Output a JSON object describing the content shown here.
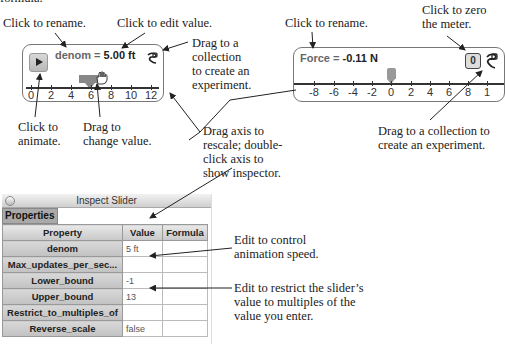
{
  "annotations": {
    "top_cut": "formula.",
    "left_rename": "Click to rename.",
    "left_edit_value": "Click to edit value.",
    "left_drag_collection": [
      "Drag to a",
      "collection",
      "to create an",
      "experiment."
    ],
    "click_animate": [
      "Click to",
      "animate."
    ],
    "drag_change": [
      "Drag to",
      "change value."
    ],
    "drag_axis": [
      "Drag axis to",
      "rescale; double-",
      "click axis to",
      "show inspector."
    ],
    "right_rename": "Click to rename.",
    "zero_meter": [
      "Click to zero",
      "the meter."
    ],
    "right_drag_collection": [
      "Drag to a collection to",
      "create an experiment."
    ],
    "edit_speed": [
      "Edit to control",
      "animation speed."
    ],
    "edit_restrict": [
      "Edit to restrict the slider’s",
      "value to multiples of the",
      "value you enter."
    ]
  },
  "slider": {
    "name": "denom",
    "equals": " = ",
    "value": "5.00 ft",
    "play_icon": "play-icon",
    "tick_labels": [
      "0",
      "2",
      "4",
      "6",
      "8",
      "10",
      "12"
    ],
    "thumb_value": 5
  },
  "meter": {
    "name": "Force",
    "equals": " = ",
    "value": "-0.11 N",
    "zero_label": "0",
    "tick_labels": [
      "-8",
      "-6",
      "-4",
      "-2",
      "0",
      "2",
      "4",
      "6",
      "8",
      "1"
    ],
    "thumb_value": 0
  },
  "inspector": {
    "title": "Inspect Slider",
    "tab": "Properties",
    "columns": [
      "Property",
      "Value",
      "Formula"
    ],
    "rows": [
      {
        "property": "denom",
        "value": "5 ft",
        "formula": ""
      },
      {
        "property": "Max_updates_per_sec...",
        "value": "",
        "formula": ""
      },
      {
        "property": "Lower_bound",
        "value": "-1",
        "formula": ""
      },
      {
        "property": "Upper_bound",
        "value": "13",
        "formula": ""
      },
      {
        "property": "Restrict_to_multiples_of",
        "value": "",
        "formula": ""
      },
      {
        "property": "Reverse_scale",
        "value": "false",
        "formula": ""
      }
    ]
  }
}
